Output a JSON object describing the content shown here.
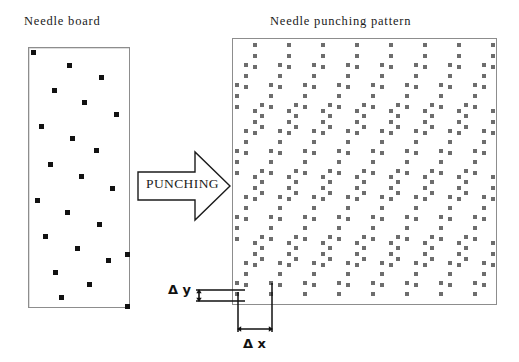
{
  "figure": {
    "width": 519,
    "height": 362,
    "background": "#ffffff",
    "dot_color_board": "#121212",
    "dot_color_pattern": "#6d6d6d",
    "line_color": "#8d8d8d",
    "text_color": "#1a1a1a"
  },
  "left_panel": {
    "title": "Needle board",
    "name": "needle-board",
    "x": 28,
    "y": 47,
    "width": 102,
    "height": 261,
    "needle_dots": [
      {
        "x": 2,
        "y": 2
      },
      {
        "x": 38,
        "y": 15
      },
      {
        "x": 70,
        "y": 27
      },
      {
        "x": 23,
        "y": 40
      },
      {
        "x": 53,
        "y": 52
      },
      {
        "x": 85,
        "y": 64
      },
      {
        "x": 10,
        "y": 76
      },
      {
        "x": 41,
        "y": 88
      },
      {
        "x": 65,
        "y": 100
      },
      {
        "x": 19,
        "y": 114
      },
      {
        "x": 50,
        "y": 126
      },
      {
        "x": 81,
        "y": 138
      },
      {
        "x": 6,
        "y": 150
      },
      {
        "x": 36,
        "y": 162
      },
      {
        "x": 68,
        "y": 174
      },
      {
        "x": 14,
        "y": 186
      },
      {
        "x": 46,
        "y": 198
      },
      {
        "x": 77,
        "y": 210
      },
      {
        "x": 24,
        "y": 222
      },
      {
        "x": 58,
        "y": 234
      },
      {
        "x": 30,
        "y": 247
      },
      {
        "x": 96,
        "y": 204
      },
      {
        "x": 96,
        "y": 256
      }
    ]
  },
  "right_panel": {
    "title": "Needle punching pattern",
    "name": "needle-punching-pattern",
    "x": 232,
    "y": 38,
    "width": 265,
    "height": 267,
    "pattern": {
      "description": "Repeating diagonal bands of vertical needle triplets",
      "dx_spacing": 34,
      "dy_spacing": 11,
      "triplet_count": 3,
      "row_shift": -9,
      "band_rows": 4,
      "band_vertical_pitch": 66,
      "columns": 9,
      "bands": 5
    }
  },
  "arrow": {
    "name": "punching-arrow",
    "label": "PUNCHING",
    "direction": "right"
  },
  "annotations": {
    "delta_y": {
      "symbol": "Δ",
      "variable": "y",
      "label": "Δ y",
      "meaning": "vertical needle spacing"
    },
    "delta_x": {
      "symbol": "Δ",
      "variable": "x",
      "label": "Δ x",
      "meaning": "horizontal needle spacing"
    }
  }
}
